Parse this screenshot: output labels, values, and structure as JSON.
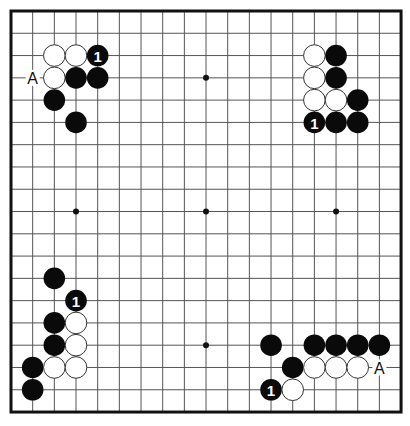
{
  "board": {
    "size": 19,
    "origin_x": 11,
    "origin_y": 11,
    "spacing_x": 21.67,
    "spacing_y": 22.28,
    "stone_radius": 10.8,
    "colors": {
      "black": "#0a0a0a",
      "white": "#ffffff",
      "grid": "#555555",
      "border": "#111111"
    }
  },
  "hoshi": [
    {
      "col": 9,
      "row": 3
    },
    {
      "col": 3,
      "row": 9
    },
    {
      "col": 9,
      "row": 9
    },
    {
      "col": 15,
      "row": 9
    },
    {
      "col": 9,
      "row": 15
    }
  ],
  "stones": [
    {
      "corner": "top-left",
      "col": 2,
      "row": 2,
      "color": "white"
    },
    {
      "corner": "top-left",
      "col": 3,
      "row": 2,
      "color": "white"
    },
    {
      "corner": "top-left",
      "col": 4,
      "row": 2,
      "color": "black",
      "label": "1"
    },
    {
      "corner": "top-left",
      "col": 2,
      "row": 3,
      "color": "white"
    },
    {
      "corner": "top-left",
      "col": 3,
      "row": 3,
      "color": "black"
    },
    {
      "corner": "top-left",
      "col": 4,
      "row": 3,
      "color": "black"
    },
    {
      "corner": "top-left",
      "col": 2,
      "row": 4,
      "color": "black"
    },
    {
      "corner": "top-left",
      "col": 3,
      "row": 5,
      "color": "black"
    },
    {
      "corner": "top-right",
      "col": 14,
      "row": 2,
      "color": "white"
    },
    {
      "corner": "top-right",
      "col": 15,
      "row": 2,
      "color": "black"
    },
    {
      "corner": "top-right",
      "col": 14,
      "row": 3,
      "color": "white"
    },
    {
      "corner": "top-right",
      "col": 15,
      "row": 3,
      "color": "black"
    },
    {
      "corner": "top-right",
      "col": 14,
      "row": 4,
      "color": "white"
    },
    {
      "corner": "top-right",
      "col": 15,
      "row": 4,
      "color": "white"
    },
    {
      "corner": "top-right",
      "col": 16,
      "row": 4,
      "color": "black"
    },
    {
      "corner": "top-right",
      "col": 14,
      "row": 5,
      "color": "black",
      "label": "1"
    },
    {
      "corner": "top-right",
      "col": 15,
      "row": 5,
      "color": "black"
    },
    {
      "corner": "top-right",
      "col": 16,
      "row": 5,
      "color": "black"
    },
    {
      "corner": "bottom-left",
      "col": 2,
      "row": 12,
      "color": "black"
    },
    {
      "corner": "bottom-left",
      "col": 3,
      "row": 13,
      "color": "black",
      "label": "1"
    },
    {
      "corner": "bottom-left",
      "col": 2,
      "row": 14,
      "color": "black"
    },
    {
      "corner": "bottom-left",
      "col": 3,
      "row": 14,
      "color": "white"
    },
    {
      "corner": "bottom-left",
      "col": 2,
      "row": 15,
      "color": "black"
    },
    {
      "corner": "bottom-left",
      "col": 3,
      "row": 15,
      "color": "white"
    },
    {
      "corner": "bottom-left",
      "col": 1,
      "row": 16,
      "color": "black"
    },
    {
      "corner": "bottom-left",
      "col": 2,
      "row": 16,
      "color": "white"
    },
    {
      "corner": "bottom-left",
      "col": 3,
      "row": 16,
      "color": "white"
    },
    {
      "corner": "bottom-left",
      "col": 1,
      "row": 17,
      "color": "black"
    },
    {
      "corner": "bottom-right",
      "col": 12,
      "row": 15,
      "color": "black"
    },
    {
      "corner": "bottom-right",
      "col": 14,
      "row": 15,
      "color": "black"
    },
    {
      "corner": "bottom-right",
      "col": 15,
      "row": 15,
      "color": "black"
    },
    {
      "corner": "bottom-right",
      "col": 16,
      "row": 15,
      "color": "black"
    },
    {
      "corner": "bottom-right",
      "col": 17,
      "row": 15,
      "color": "black"
    },
    {
      "corner": "bottom-right",
      "col": 13,
      "row": 16,
      "color": "black"
    },
    {
      "corner": "bottom-right",
      "col": 14,
      "row": 16,
      "color": "white"
    },
    {
      "corner": "bottom-right",
      "col": 15,
      "row": 16,
      "color": "white"
    },
    {
      "corner": "bottom-right",
      "col": 16,
      "row": 16,
      "color": "white"
    },
    {
      "corner": "bottom-right",
      "col": 12,
      "row": 17,
      "color": "black",
      "label": "1"
    },
    {
      "corner": "bottom-right",
      "col": 13,
      "row": 17,
      "color": "white"
    }
  ],
  "marks": [
    {
      "corner": "top-left",
      "col": 1,
      "row": 3,
      "text": "A"
    },
    {
      "corner": "bottom-right",
      "col": 17,
      "row": 16,
      "text": "A"
    }
  ]
}
